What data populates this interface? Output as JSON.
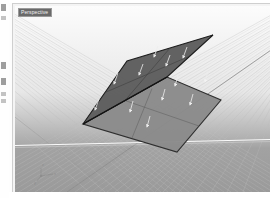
{
  "app": {
    "title": "3D CAD Viewport",
    "viewport_label": "Perspective"
  },
  "left_toolbar": {
    "name": "clipped-side-toolbar",
    "icons": [
      {
        "name": "tool-icon-1",
        "y": 4,
        "faint": false
      },
      {
        "name": "tool-icon-2",
        "y": 16,
        "faint": true
      },
      {
        "name": "tool-icon-3",
        "y": 62,
        "faint": false
      },
      {
        "name": "tool-icon-4",
        "y": 78,
        "faint": false
      },
      {
        "name": "tool-icon-5",
        "y": 92,
        "faint": true
      },
      {
        "name": "tool-icon-6",
        "y": 99,
        "faint": true
      }
    ]
  },
  "viewport": {
    "background_top": "#fbfbfb",
    "background_bottom": "#9e9e9e",
    "grid_line_color": "#b9b9b9",
    "grid_major_color": "#8e8e8e",
    "axis_line_color": "#ffffff",
    "horizon_y": 140,
    "camera": "perspective",
    "axis_gizmo": {
      "name": "axis-gizmo",
      "x": 30,
      "y": 168,
      "labels": [
        "x",
        "y",
        "z"
      ]
    }
  },
  "geometry": {
    "name": "two-folded-planar-surfaces",
    "description": "Two rectangular planar surfaces joined along a shared edge, open like a book, with surface normal direction arrows displayed.",
    "surfaces": [
      {
        "name": "upper-surface",
        "fill": "#5e5e5e",
        "stroke": "#1f1f1f",
        "points": "105,95 150,42 205,28 163,73",
        "normal_arrow_count": 6
      },
      {
        "name": "lower-surface",
        "fill": "#8b8b8b",
        "stroke": "#2b2b2b",
        "points": "82,120 163,73 216,96 173,146",
        "normal_arrow_count": 6
      }
    ],
    "normal_arrows": {
      "name": "normal-direction-arrows",
      "color": "#ededed",
      "count": 12
    }
  }
}
